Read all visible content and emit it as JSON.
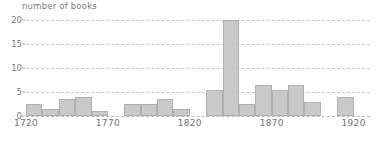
{
  "chart_data": {
    "type": "bar",
    "title": "number of books",
    "xlabel": "",
    "ylabel": "number of books",
    "grid": true,
    "legend": "none",
    "bin_width": 10,
    "xlim": [
      1720,
      1930
    ],
    "ylim": [
      0,
      20
    ],
    "yticks": [
      0,
      5,
      10,
      15,
      20
    ],
    "xticks": [
      1720,
      1770,
      1820,
      1870,
      1920
    ],
    "xtick_labels": [
      "1720",
      "1770",
      "1820",
      "1870",
      "1920"
    ],
    "categories": [
      "1720",
      "1730",
      "1740",
      "1750",
      "1760",
      "1770",
      "1780",
      "1790",
      "1800",
      "1810",
      "1820",
      "1830",
      "1840",
      "1850",
      "1860",
      "1870",
      "1880",
      "1890",
      "1900",
      "1910"
    ],
    "values": [
      2.5,
      1.5,
      3.5,
      4,
      1,
      0,
      2.5,
      2.5,
      3.5,
      1.5,
      0,
      5.5,
      20,
      2.5,
      6.5,
      5.5,
      6.5,
      3,
      0,
      4
    ],
    "bar_color": "#c9c9c9",
    "bar_edge_color": "#b0b0b0",
    "grid_color": "#c4c4c4",
    "text_color": "#6f6f6f"
  }
}
